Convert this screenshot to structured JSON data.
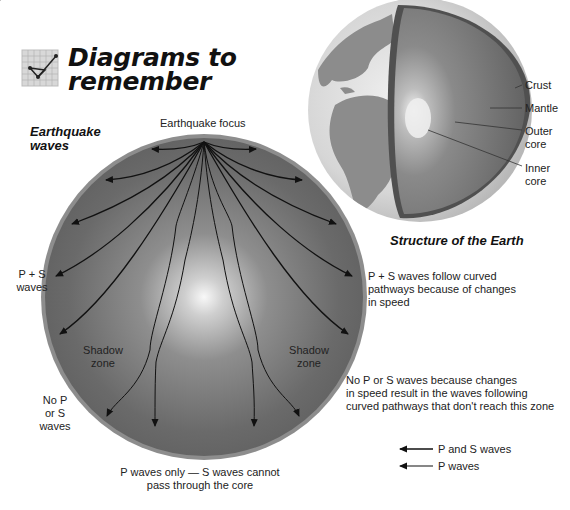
{
  "header": {
    "title_line1": "Diagrams to",
    "title_line2": "remember",
    "icon": "graph-check-icon"
  },
  "earthquake_diagram": {
    "caption_line1": "Earthquake",
    "caption_line2": "waves",
    "focus_label": "Earthquake focus",
    "ps_waves_label_line1": "P + S",
    "ps_waves_label_line2": "waves",
    "shadow_zone_left_line1": "Shadow",
    "shadow_zone_left_line2": "zone",
    "shadow_zone_right_line1": "Shadow",
    "shadow_zone_right_line2": "zone",
    "no_ps_line1": "No P",
    "no_ps_line2": "or S",
    "no_ps_line3": "waves",
    "curved_note_line1": "P + S waves follow curved",
    "curved_note_line2": "pathways because of changes",
    "curved_note_line3": "in speed",
    "shadow_note_line1": "No P or S waves because changes",
    "shadow_note_line2": "in speed result in the waves following",
    "shadow_note_line3": "curved pathways that don't reach this zone",
    "p_only_line1": "P waves only — S waves cannot",
    "p_only_line2": "pass through the core"
  },
  "legend": {
    "items": [
      {
        "label": "P and S waves",
        "icon": "arrow-left-icon"
      },
      {
        "label": "P waves",
        "icon": "arrow-left-icon"
      }
    ]
  },
  "earth_structure": {
    "caption": "Structure of the Earth",
    "layers": [
      "Crust",
      "Mantle",
      "Outer core",
      "Inner core"
    ],
    "crust": "Crust",
    "mantle": "Mantle",
    "outer_core_line1": "Outer",
    "outer_core_line2": "core",
    "inner_core_line1": "Inner",
    "inner_core_line2": "core"
  },
  "colors": {
    "circle_fill": "#6e6e6e",
    "circle_rim": "#9a9a9a",
    "core_glow": "#f5f5f5",
    "globe_ocean": "#d4d4d4",
    "globe_land": "#8c8c8c",
    "cut_face": "#6a6a6a",
    "wave_line": "#111111"
  }
}
